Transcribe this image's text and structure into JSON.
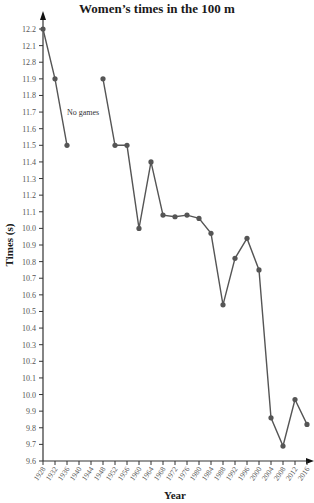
{
  "chart_data": {
    "type": "line",
    "title": "Women’s times in the 100 m",
    "xlabel": "Year",
    "ylabel": "Times (s)",
    "x_tick_labels": [
      "1928",
      "1932",
      "1936",
      "1940",
      "1944",
      "1948",
      "1952",
      "1956",
      "1960",
      "1964",
      "1968",
      "1972",
      "1976",
      "1980",
      "1984",
      "1988",
      "1992",
      "1996",
      "2000",
      "2004",
      "2008",
      "2012",
      "2016"
    ],
    "y_tick_labels": [
      "12.2",
      "12.1",
      "12.8",
      "11.9",
      "11.8",
      "11.7",
      "11.6",
      "11.5",
      "11.4",
      "11.3",
      "11.2",
      "11.1",
      "10.0",
      "10.9",
      "10.8",
      "10.7",
      "10.6",
      "10.5",
      "10.4",
      "10.3",
      "10.2",
      "10.1",
      "10.0",
      "9.9",
      "9.8",
      "9.7",
      "9.6"
    ],
    "ylim": [
      9.6,
      12.2
    ],
    "xlim": [
      1928,
      2016
    ],
    "grid": false,
    "legend": null,
    "annotations": [
      {
        "text": "No games",
        "x": 1940,
        "y": 11.7
      }
    ],
    "series": [
      {
        "name": "Women's 100 m winning time",
        "segments": [
          {
            "x": [
              1928,
              1932,
              1936
            ],
            "y": [
              12.2,
              11.9,
              11.5
            ]
          },
          {
            "x": [
              1948,
              1952,
              1956,
              1960,
              1964,
              1968,
              1972,
              1976,
              1980,
              1984,
              1988,
              1992,
              1996,
              2000,
              2004,
              2008,
              2012,
              2016
            ],
            "y": [
              11.9,
              11.5,
              11.5,
              11.0,
              11.4,
              11.08,
              11.07,
              11.08,
              11.06,
              10.97,
              10.54,
              10.82,
              10.94,
              10.75,
              9.86,
              9.69,
              9.97,
              9.82
            ]
          }
        ]
      }
    ],
    "colors": {
      "line": "#555555",
      "marker": "#555555",
      "axis": "#333333"
    }
  }
}
